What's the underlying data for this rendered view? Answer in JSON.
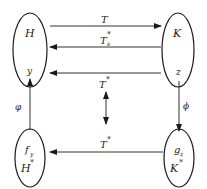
{
  "diagram": {
    "nodes": {
      "H": {
        "label": "H",
        "point": "y"
      },
      "K": {
        "label": "K",
        "point": "z"
      },
      "Hstar": {
        "label": "H",
        "sup": "*",
        "point": "f",
        "point_sub": "y"
      },
      "Kstar": {
        "label": "K",
        "sup": "*",
        "point": "g",
        "point_sub": "z"
      }
    },
    "edges": {
      "T": {
        "label": "T",
        "direction": "H→K"
      },
      "Ts_star": {
        "label": "T",
        "sub": "s",
        "sup": "*",
        "direction": "K→H"
      },
      "T_star_mid": {
        "label": "T",
        "sup": "*",
        "direction": "z→y"
      },
      "T_star_vertical": {
        "label": "T",
        "sup": "*",
        "direction": "bidirectional"
      },
      "T_star_bottom": {
        "label": "T",
        "sup": "*",
        "direction": "K*→H*"
      },
      "phi_left": {
        "label": "φ",
        "direction": "y→f_y"
      },
      "phi_right": {
        "label": "ϕ",
        "direction": "z→g_z"
      }
    },
    "colors": {
      "stroke": "#1a1a1a",
      "text": "#222222",
      "background": "#ffffff"
    }
  }
}
